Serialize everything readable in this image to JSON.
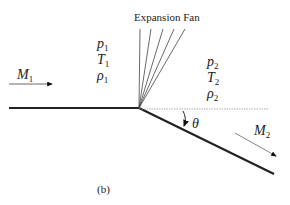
{
  "title": "Expansion Fan",
  "caption": "(b)",
  "upstream": {
    "mach": {
      "sym": "M",
      "sub": "1"
    },
    "props": [
      {
        "sym": "p",
        "sub": "1"
      },
      {
        "sym": "T",
        "sub": "1"
      },
      {
        "sym": "ρ",
        "sub": "1"
      }
    ]
  },
  "downstream": {
    "mach": {
      "sym": "M",
      "sub": "2"
    },
    "props": [
      {
        "sym": "p",
        "sub": "2"
      },
      {
        "sym": "T",
        "sub": "2"
      },
      {
        "sym": "ρ",
        "sub": "2"
      }
    ]
  },
  "angle": {
    "sym": "θ"
  }
}
